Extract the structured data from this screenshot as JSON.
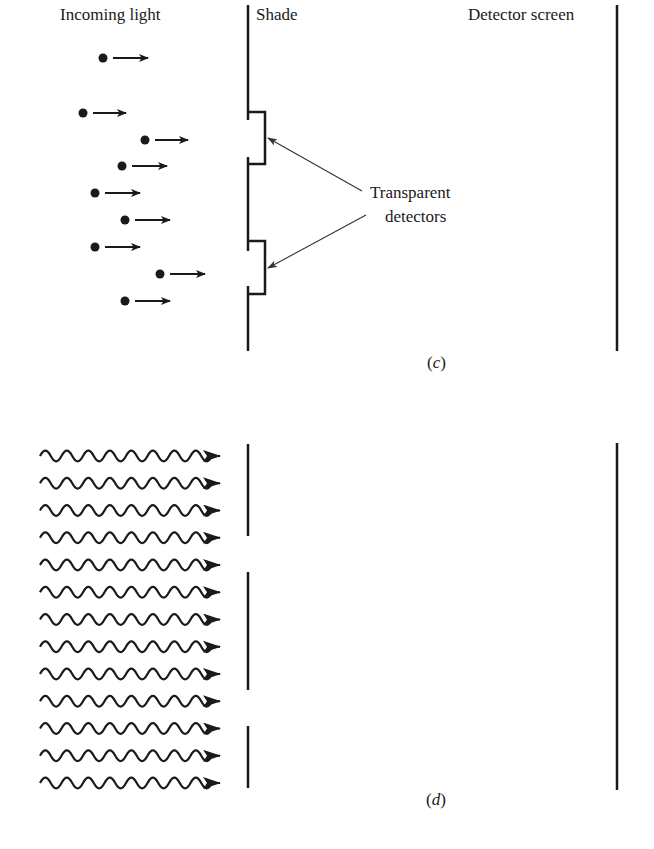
{
  "labels": {
    "incoming_light": "Incoming light",
    "shade": "Shade",
    "detector_screen": "Detector screen",
    "transparent_detectors_line1": "Transparent",
    "transparent_detectors_line2": "detectors"
  },
  "panels": {
    "c": {
      "open": "(",
      "letter": "c",
      "close": ")"
    },
    "d": {
      "open": "(",
      "letter": "d",
      "close": ")"
    }
  },
  "panel_c": {
    "particles": [
      {
        "x": 103,
        "y": 58,
        "arrow_end": 148
      },
      {
        "x": 83,
        "y": 113,
        "arrow_end": 126
      },
      {
        "x": 145,
        "y": 140,
        "arrow_end": 188
      },
      {
        "x": 122,
        "y": 166,
        "arrow_end": 167
      },
      {
        "x": 95,
        "y": 193,
        "arrow_end": 140
      },
      {
        "x": 125,
        "y": 220,
        "arrow_end": 170
      },
      {
        "x": 95,
        "y": 247,
        "arrow_end": 140
      },
      {
        "x": 160,
        "y": 274,
        "arrow_end": 205
      },
      {
        "x": 125,
        "y": 301,
        "arrow_end": 170
      }
    ],
    "transparent_detectors": [
      {
        "top": 112,
        "bottom": 164
      },
      {
        "top": 241,
        "bottom": 294
      }
    ]
  },
  "panel_d": {
    "wave_rows": 13,
    "first_row_y": 456,
    "row_spacing": 27.25,
    "shade_segments": [
      {
        "top": 444,
        "bottom": 536
      },
      {
        "top": 572,
        "bottom": 690
      },
      {
        "top": 726,
        "bottom": 788
      }
    ]
  },
  "colors": {
    "ink": "#1a1a1a",
    "leader": "#333333"
  }
}
